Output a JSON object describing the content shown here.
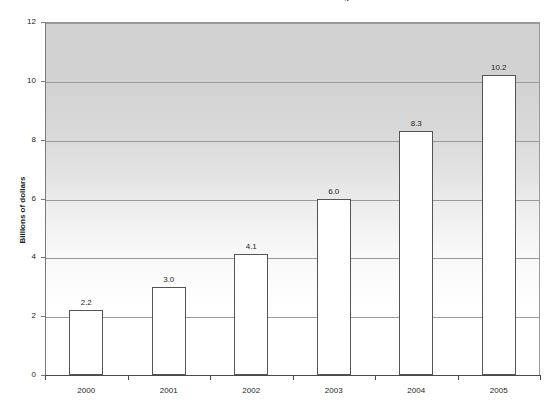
{
  "chart_data": {
    "type": "bar",
    "title": "Estimated Costs for Smart Building",
    "xlabel": "",
    "ylabel": "Billions of dollars",
    "categories": [
      "2000",
      "2001",
      "2002",
      "2003",
      "2004",
      "2005"
    ],
    "values": [
      2.2,
      3.0,
      4.1,
      6.0,
      8.3,
      10.2
    ],
    "value_labels": [
      "2.2",
      "3.0",
      "4.1",
      "6.0",
      "8.3",
      "10.2"
    ],
    "ylim": [
      0,
      12
    ],
    "ytick_labels": [
      "0",
      "2",
      "4",
      "6",
      "8",
      "10",
      "12"
    ],
    "yticks": [
      0,
      2,
      4,
      6,
      8,
      10,
      12
    ],
    "grid": true,
    "legend": false,
    "series": [
      {
        "name": "Cost",
        "values": [
          2.2,
          3.0,
          4.1,
          6.0,
          8.3,
          10.2
        ]
      }
    ],
    "colors": {
      "bar_fill": "#ffffff",
      "bar_border": "#545454",
      "gridline": "#9a9a9a",
      "axis": "#4a4a4a",
      "plot_bg_top": "#d2d2d2",
      "plot_bg_bottom": "#ffffff",
      "text": "#1f1f1f"
    }
  }
}
